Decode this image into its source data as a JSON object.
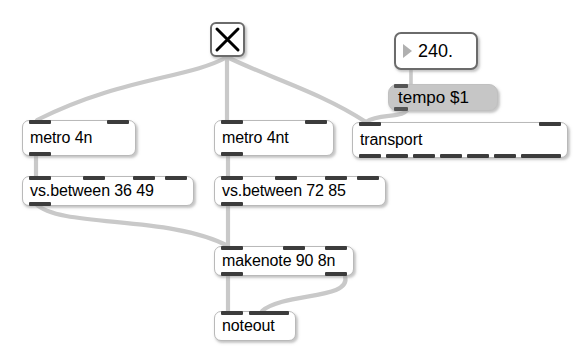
{
  "patch": {
    "title": "Max/MSP patcher",
    "background_color": "#ffffff",
    "cord_color": "#c9c9c9",
    "nub_color": "#3c3c3c",
    "box_border_color": "#b9b9b9",
    "message_fill_color": "#c6c6c6"
  },
  "toggle": {
    "name": "toggle",
    "glyph": "X",
    "state": "on"
  },
  "number_box": {
    "value": "240.",
    "triangle": "number-triangle-icon"
  },
  "message_box": {
    "text": "tempo $1"
  },
  "objects": {
    "metro_4n": {
      "text": "metro 4n",
      "inlets": 2,
      "outlets": 1
    },
    "metro_4nt": {
      "text": "metro 4nt",
      "inlets": 2,
      "outlets": 1
    },
    "transport": {
      "text": "transport",
      "inlets": 2,
      "outlets": 8
    },
    "vs_between_36_49": {
      "text": "vs.between 36 49",
      "inlets": 4,
      "outlets": 1
    },
    "vs_between_72_85": {
      "text": "vs.between 72 85",
      "inlets": 4,
      "outlets": 1
    },
    "makenote": {
      "text": "makenote 90 8n",
      "inlets": 3,
      "outlets": 2
    },
    "noteout": {
      "text": "noteout",
      "inlets": 3,
      "outlets": 0
    }
  },
  "connections": [
    {
      "from": "toggle",
      "to": "metro_4n"
    },
    {
      "from": "toggle",
      "to": "metro_4nt"
    },
    {
      "from": "toggle",
      "to": "transport"
    },
    {
      "from": "number_box",
      "to": "message_box"
    },
    {
      "from": "message_box",
      "to": "transport"
    },
    {
      "from": "metro_4n",
      "to": "vs_between_36_49"
    },
    {
      "from": "metro_4nt",
      "to": "vs_between_72_85"
    },
    {
      "from": "vs_between_36_49",
      "to": "makenote"
    },
    {
      "from": "vs_between_72_85",
      "to": "makenote"
    },
    {
      "from": "makenote",
      "to": "noteout"
    },
    {
      "from": "makenote_right",
      "to": "noteout_middle"
    }
  ]
}
